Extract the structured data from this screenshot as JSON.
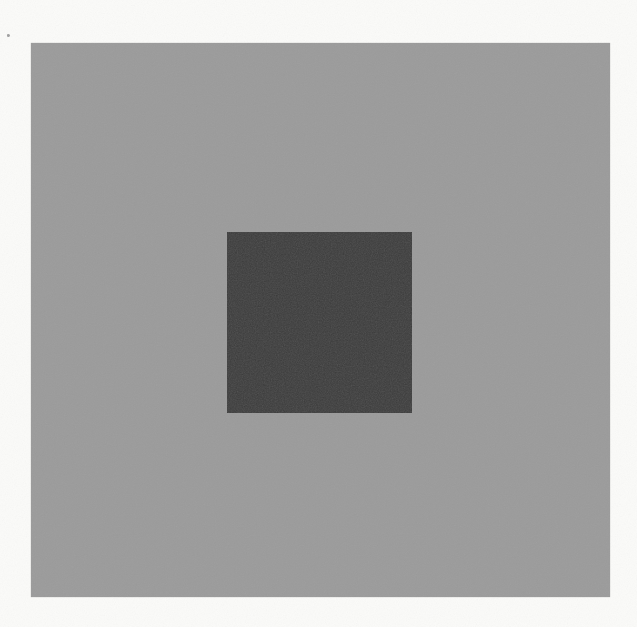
{
  "figure": {
    "kind": "grayscale-contrast-stimulus",
    "elements": {
      "page_background": {
        "name": "white-page",
        "color": "#fbfbf9"
      },
      "outer_square": {
        "name": "outer-gray-square",
        "color": "#9b9b9b"
      },
      "inner_square": {
        "name": "inner-dark-square",
        "color": "#383838"
      },
      "speck": {
        "name": "scan-speck",
        "color": "#8a8a8a"
      }
    }
  }
}
